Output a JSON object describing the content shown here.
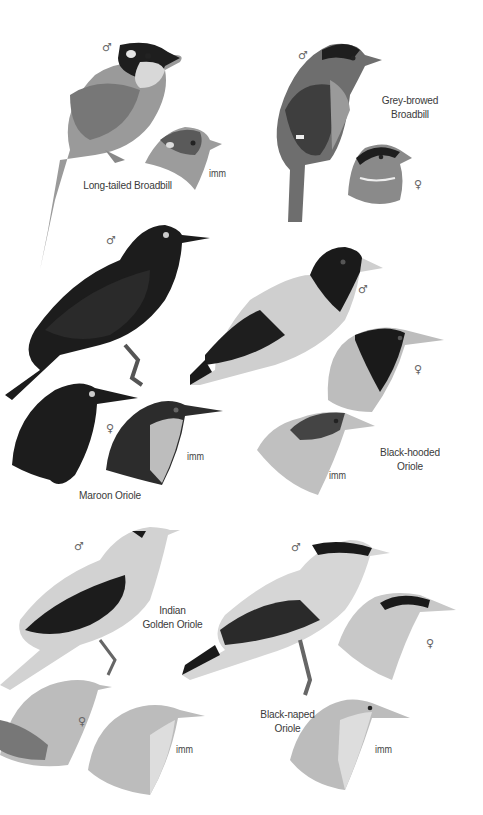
{
  "plate": {
    "species": [
      {
        "name_lines": [
          "Long-tailed Broadbill"
        ],
        "figures": [
          {
            "sex_symbol": "♂"
          },
          {
            "age_label": "imm"
          }
        ]
      },
      {
        "name_lines": [
          "Grey-browed",
          "Broadbill"
        ],
        "figures": [
          {
            "sex_symbol": "♂"
          },
          {
            "sex_symbol": "♀"
          }
        ]
      },
      {
        "name_lines": [
          "Maroon Oriole"
        ],
        "figures": [
          {
            "sex_symbol": "♂"
          },
          {
            "sex_symbol": "♀"
          },
          {
            "age_label": "imm"
          }
        ]
      },
      {
        "name_lines": [
          "Black-hooded",
          "Oriole"
        ],
        "figures": [
          {
            "sex_symbol": "♂"
          },
          {
            "sex_symbol": "♀"
          },
          {
            "age_label": "imm"
          }
        ]
      },
      {
        "name_lines": [
          "Indian",
          "Golden Oriole"
        ],
        "figures": [
          {
            "sex_symbol": "♂"
          },
          {
            "sex_symbol": "♀"
          },
          {
            "age_label": "imm"
          }
        ]
      },
      {
        "name_lines": [
          "Black-naped",
          "Oriole"
        ],
        "figures": [
          {
            "sex_symbol": "♂"
          },
          {
            "sex_symbol": "♀"
          },
          {
            "age_label": "imm"
          }
        ]
      }
    ]
  },
  "colors": {
    "background": "#ffffff",
    "label_text": "#3a3a3a",
    "plumage_black": "#1a1a1a",
    "plumage_dark_grey": "#4a4a4a",
    "plumage_mid_grey": "#8a8a8a",
    "plumage_light_grey": "#c4c4c4",
    "plumage_pale": "#dcdcdc"
  }
}
